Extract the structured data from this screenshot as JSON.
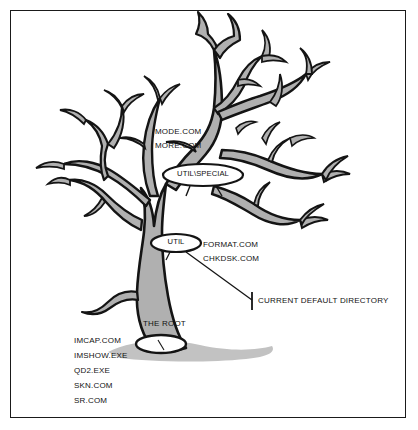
{
  "figure": {
    "border_color": "#1a1a1a",
    "background": "#ffffff"
  },
  "tree": {
    "outline_color": "#141414",
    "fill_color": "#b0b0b0",
    "shadow_color": "#bdbdbd"
  },
  "callouts": [
    {
      "id": "util_special",
      "label": "UTIL\\SPECIAL"
    },
    {
      "id": "util",
      "label": "UTIL"
    },
    {
      "id": "the_root",
      "label": "THE ROOT"
    }
  ],
  "special_files": {
    "items": [
      {
        "name": "MODE.COM"
      },
      {
        "name": "MORE.COM"
      }
    ]
  },
  "util_files": {
    "items": [
      {
        "name": "FORMAT.COM"
      },
      {
        "name": "CHKDSK.COM"
      }
    ]
  },
  "root_files": {
    "items": [
      {
        "name": "IMCAP.COM"
      },
      {
        "name": "IMSHOW.EXE"
      },
      {
        "name": "QD2.EXE"
      },
      {
        "name": "SKN.COM"
      },
      {
        "name": "SR.COM"
      }
    ]
  },
  "annotation": {
    "current_default_directory": "CURRENT DEFAULT DIRECTORY"
  }
}
